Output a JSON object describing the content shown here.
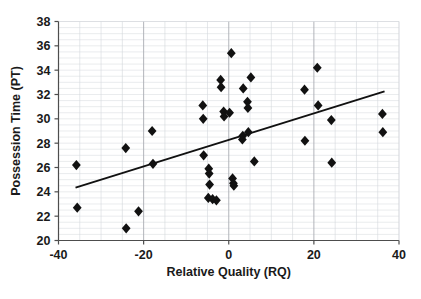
{
  "chart_data": {
    "type": "scatter",
    "title": "",
    "xlabel": "Relative Quality (RQ)",
    "ylabel": "Possession Time (PT)",
    "xlim": [
      -40,
      40
    ],
    "ylim": [
      20,
      38
    ],
    "xticks": [
      -40,
      -20,
      0,
      20,
      40
    ],
    "xtick_labels": [
      "-40",
      "-20",
      "0",
      "20",
      "40"
    ],
    "yticks": [
      20,
      22,
      24,
      26,
      28,
      30,
      32,
      34,
      36,
      38
    ],
    "ytick_labels": [
      "20",
      "22",
      "24",
      "26",
      "28",
      "30",
      "32",
      "34",
      "36",
      "38"
    ],
    "grid": true,
    "grid_minor_x_step": 5,
    "grid_minor_y_step": 0.5,
    "grid_major_x": [
      -20,
      0,
      20
    ],
    "legend": "none",
    "marker": "diamond",
    "marker_color": "#111111",
    "points": [
      {
        "x": -35.8,
        "y": 26.2
      },
      {
        "x": -35.6,
        "y": 22.7
      },
      {
        "x": -24.2,
        "y": 27.6
      },
      {
        "x": -24.1,
        "y": 21.0
      },
      {
        "x": -21.2,
        "y": 22.4
      },
      {
        "x": -18.0,
        "y": 29.0
      },
      {
        "x": -17.8,
        "y": 26.3
      },
      {
        "x": -6.1,
        "y": 31.1
      },
      {
        "x": -6.0,
        "y": 30.0
      },
      {
        "x": -5.9,
        "y": 27.0
      },
      {
        "x": -4.7,
        "y": 25.9
      },
      {
        "x": -4.6,
        "y": 25.5
      },
      {
        "x": -4.5,
        "y": 24.6
      },
      {
        "x": -4.8,
        "y": 23.5
      },
      {
        "x": -3.8,
        "y": 23.4
      },
      {
        "x": -2.9,
        "y": 23.3
      },
      {
        "x": -1.9,
        "y": 33.2
      },
      {
        "x": -1.8,
        "y": 32.6
      },
      {
        "x": -1.2,
        "y": 30.6
      },
      {
        "x": -1.1,
        "y": 30.2
      },
      {
        "x": 0.2,
        "y": 30.5
      },
      {
        "x": 0.6,
        "y": 35.4
      },
      {
        "x": 0.9,
        "y": 25.1
      },
      {
        "x": 1.1,
        "y": 24.7
      },
      {
        "x": 1.2,
        "y": 24.5
      },
      {
        "x": 3.4,
        "y": 32.5
      },
      {
        "x": 3.3,
        "y": 28.6
      },
      {
        "x": 3.2,
        "y": 28.3
      },
      {
        "x": 4.4,
        "y": 31.4
      },
      {
        "x": 4.5,
        "y": 30.9
      },
      {
        "x": 4.6,
        "y": 28.9
      },
      {
        "x": 5.2,
        "y": 33.4
      },
      {
        "x": 6.0,
        "y": 26.5
      },
      {
        "x": 17.8,
        "y": 32.4
      },
      {
        "x": 17.9,
        "y": 28.2
      },
      {
        "x": 20.8,
        "y": 34.2
      },
      {
        "x": 21.0,
        "y": 31.1
      },
      {
        "x": 24.1,
        "y": 29.9
      },
      {
        "x": 24.2,
        "y": 26.4
      },
      {
        "x": 36.1,
        "y": 30.4
      },
      {
        "x": 36.2,
        "y": 28.9
      }
    ],
    "trendline": {
      "x_start": -36.0,
      "y_start": 24.35,
      "x_end": 36.6,
      "y_end": 32.25
    }
  }
}
